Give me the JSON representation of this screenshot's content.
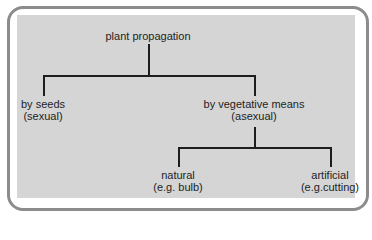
{
  "diagram": {
    "type": "tree",
    "root": {
      "label": "plant propagation"
    },
    "level1": [
      {
        "label": "by seeds",
        "sublabel": "(sexual)"
      },
      {
        "label": "by vegetative means",
        "sublabel": "(asexual)"
      }
    ],
    "level2": [
      {
        "label": "natural",
        "sublabel": "(e.g. bulb)"
      },
      {
        "label": "artificial",
        "sublabel": "(e.g.cutting)"
      }
    ],
    "edges": [
      [
        "plant propagation",
        "by seeds (sexual)"
      ],
      [
        "plant propagation",
        "by vegetative means (asexual)"
      ],
      [
        "by vegetative means (asexual)",
        "natural (e.g. bulb)"
      ],
      [
        "by vegetative means (asexual)",
        "artificial (e.g.cutting)"
      ]
    ]
  },
  "colors": {
    "panel": "#d5d5d5",
    "frame_border": "#8c8c8c",
    "text": "#1e1e1e"
  }
}
